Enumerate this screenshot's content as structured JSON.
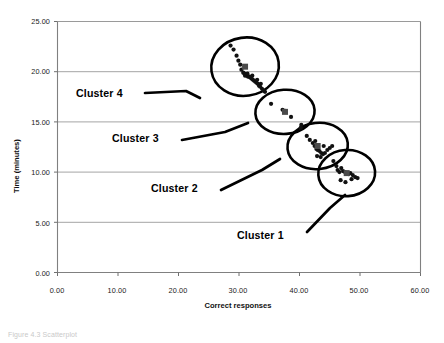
{
  "chart_data": {
    "type": "scatter",
    "title": "",
    "xlabel": "Correct responses",
    "ylabel": "Time (minutes)",
    "xlim": [
      0,
      60
    ],
    "ylim": [
      0,
      25
    ],
    "xticks": [
      "0.00",
      "10.00",
      "20.00",
      "30.00",
      "40.00",
      "50.00",
      "60.00"
    ],
    "yticks": [
      "0.00",
      "5.00",
      "10.00",
      "15.00",
      "20.00",
      "25.00"
    ],
    "xtick_values": [
      0,
      10,
      20,
      30,
      40,
      50,
      60
    ],
    "ytick_values": [
      0,
      5,
      10,
      15,
      20,
      25
    ],
    "grid": "horizontal",
    "legend": "none",
    "marker_color": "#111111",
    "annotations": [
      {
        "label": "Cluster 4",
        "x": 12.5,
        "y": 17.8
      },
      {
        "label": "Cluster 3",
        "x": 18.5,
        "y": 13.4
      },
      {
        "label": "Cluster 2",
        "x": 25.0,
        "y": 9.4
      },
      {
        "label": "Cluster 1",
        "x": 33.5,
        "y": 4.9
      }
    ],
    "clusters": [
      {
        "name": "Cluster 4",
        "ellipse": {
          "cx": 31.0,
          "cy": 20.5,
          "rx": 5.6,
          "ry": 2.9
        },
        "points": [
          [
            28.6,
            22.6
          ],
          [
            29.1,
            22.2
          ],
          [
            29.6,
            21.6
          ],
          [
            29.9,
            21.1
          ],
          [
            30.2,
            20.7
          ],
          [
            30.4,
            20.2
          ],
          [
            30.7,
            19.9
          ],
          [
            30.9,
            19.8
          ],
          [
            31.1,
            19.7
          ],
          [
            31.3,
            19.6
          ],
          [
            31.5,
            19.5
          ],
          [
            31.7,
            19.5
          ],
          [
            31.9,
            19.4
          ],
          [
            32.1,
            19.3
          ],
          [
            32.3,
            19.2
          ],
          [
            32.5,
            19.1
          ],
          [
            32.7,
            19.0
          ],
          [
            32.9,
            18.9
          ],
          [
            33.1,
            18.8
          ],
          [
            33.3,
            18.6
          ],
          [
            33.5,
            18.5
          ],
          [
            33.8,
            18.3
          ],
          [
            34.1,
            18.1
          ],
          [
            31.0,
            19.6
          ],
          [
            31.4,
            19.8
          ],
          [
            32.2,
            19.6
          ],
          [
            33.0,
            19.2
          ],
          [
            33.6,
            18.8
          ],
          [
            34.3,
            18.0
          ]
        ]
      },
      {
        "name": "Cluster 3",
        "ellipse": {
          "cx": 37.6,
          "cy": 16.0,
          "rx": 4.9,
          "ry": 2.2
        },
        "points": [
          [
            35.3,
            16.8
          ],
          [
            37.2,
            16.2
          ],
          [
            37.6,
            16.1
          ],
          [
            38.6,
            15.5
          ],
          [
            40.3,
            14.7
          ]
        ]
      },
      {
        "name": "Cluster 2",
        "ellipse": {
          "cx": 43.0,
          "cy": 12.6,
          "rx": 5.0,
          "ry": 2.3
        },
        "points": [
          [
            40.2,
            14.4
          ],
          [
            41.2,
            13.6
          ],
          [
            41.7,
            13.2
          ],
          [
            42.2,
            12.9
          ],
          [
            42.5,
            12.6
          ],
          [
            42.8,
            12.3
          ],
          [
            43.0,
            12.2
          ],
          [
            43.3,
            12.1
          ],
          [
            43.6,
            11.9
          ],
          [
            43.9,
            11.8
          ],
          [
            44.2,
            11.9
          ],
          [
            44.6,
            12.2
          ],
          [
            45.0,
            12.4
          ],
          [
            45.4,
            12.6
          ],
          [
            42.9,
            11.6
          ],
          [
            43.5,
            11.5
          ],
          [
            44.0,
            12.6
          ],
          [
            42.6,
            13.1
          ]
        ]
      },
      {
        "name": "Cluster 1",
        "ellipse": {
          "cx": 47.8,
          "cy": 9.9,
          "rx": 4.7,
          "ry": 2.3
        },
        "points": [
          [
            45.6,
            11.1
          ],
          [
            46.1,
            10.6
          ],
          [
            46.3,
            10.2
          ],
          [
            46.6,
            10.0
          ],
          [
            46.9,
            10.4
          ],
          [
            47.2,
            10.1
          ],
          [
            47.5,
            10.0
          ],
          [
            47.8,
            9.9
          ],
          [
            48.1,
            9.8
          ],
          [
            48.4,
            9.9
          ],
          [
            48.8,
            9.7
          ],
          [
            49.2,
            9.5
          ],
          [
            46.8,
            9.2
          ],
          [
            47.6,
            9.0
          ],
          [
            48.6,
            9.3
          ],
          [
            49.6,
            9.4
          ]
        ]
      }
    ]
  },
  "figure": {
    "caption": "Figure 4.3  Scatterplot"
  }
}
